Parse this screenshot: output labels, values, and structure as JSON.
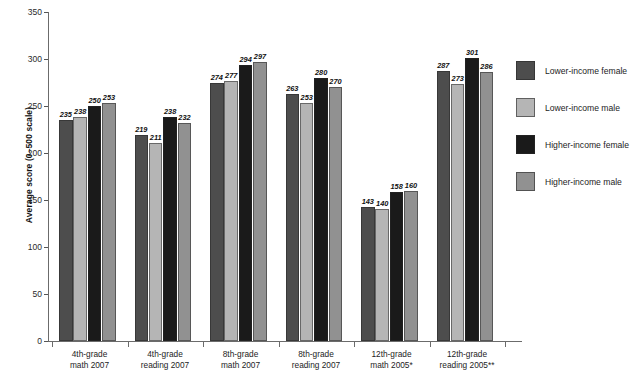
{
  "chart_data": {
    "type": "bar",
    "title": "",
    "xlabel": "",
    "ylabel": "Average score (0–500 scale)",
    "ylim": [
      0,
      350
    ],
    "ytick_step": 50,
    "yticks": [
      0,
      50,
      100,
      150,
      200,
      250,
      300,
      350
    ],
    "grid": false,
    "legend_position": "right",
    "categories": [
      "4th-grade math 2007",
      "4th-grade reading 2007",
      "8th-grade math 2007",
      "8th-grade reading 2007",
      "12th-grade math 2005*",
      "12th-grade reading 2005**"
    ],
    "category_lines": [
      [
        "4th-grade",
        "math 2007"
      ],
      [
        "4th-grade",
        "reading 2007"
      ],
      [
        "8th-grade",
        "math 2007"
      ],
      [
        "8th-grade",
        "reading 2007"
      ],
      [
        "12th-grade",
        "math 2005*"
      ],
      [
        "12th-grade",
        "reading 2005**"
      ]
    ],
    "series": [
      {
        "name": "Lower-income female",
        "color": "#4d4d4d",
        "values": [
          235,
          219,
          274,
          263,
          143,
          287
        ]
      },
      {
        "name": "Lower-income male",
        "color": "#b5b5b5",
        "values": [
          238,
          211,
          277,
          253,
          140,
          273
        ]
      },
      {
        "name": "Higher-income female",
        "color": "#1a1a1a",
        "values": [
          250,
          238,
          294,
          280,
          158,
          301
        ]
      },
      {
        "name": "Higher-income male",
        "color": "#919191",
        "values": [
          253,
          232,
          297,
          270,
          160,
          286
        ]
      }
    ]
  },
  "axis": {
    "y_title": "Average score (0–500 scale)",
    "y_labels": [
      "350",
      "300",
      "250",
      "200",
      "150",
      "100",
      "50",
      "0"
    ]
  },
  "legend": {
    "items": [
      {
        "label": "Lower-income female",
        "color": "#4d4d4d",
        "icon": "legend-swatch-icon"
      },
      {
        "label": "Lower-income male",
        "color": "#b5b5b5",
        "icon": "legend-swatch-icon"
      },
      {
        "label": "Higher-income female",
        "color": "#1a1a1a",
        "icon": "legend-swatch-icon"
      },
      {
        "label": "Higher-income male",
        "color": "#919191",
        "icon": "legend-swatch-icon"
      }
    ]
  },
  "footnote": {
    "text": ""
  }
}
